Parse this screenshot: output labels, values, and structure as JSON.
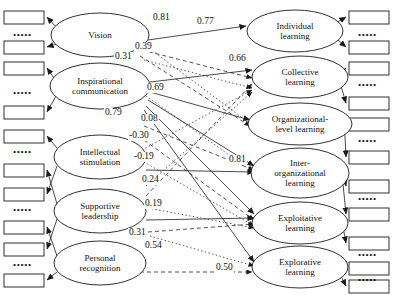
{
  "diagram": {
    "indicator_ellipsis": "•••••",
    "exogenous_constructs": [
      {
        "id": "vision",
        "label_lines": [
          "Vision"
        ],
        "cx": 100,
        "cy": 35,
        "rx": 49,
        "ry": 22
      },
      {
        "id": "inspirational",
        "label_lines": [
          "Inspirational",
          "communication"
        ],
        "cx": 100,
        "cy": 86,
        "rx": 50,
        "ry": 23
      },
      {
        "id": "intellectual",
        "label_lines": [
          "Intellectual",
          "stimulation"
        ],
        "cx": 100,
        "cy": 157,
        "rx": 46,
        "ry": 22
      },
      {
        "id": "supportive",
        "label_lines": [
          "Supportive",
          "leadership"
        ],
        "cx": 100,
        "cy": 211,
        "rx": 46,
        "ry": 22
      },
      {
        "id": "personal",
        "label_lines": [
          "Personal",
          "recognition"
        ],
        "cx": 100,
        "cy": 263,
        "rx": 46,
        "ry": 22
      }
    ],
    "endogenous_constructs": [
      {
        "id": "individual",
        "label_lines": [
          "Individual",
          "learning"
        ],
        "cx": 295,
        "cy": 31,
        "rx": 48,
        "ry": 21
      },
      {
        "id": "collective",
        "label_lines": [
          "Collective",
          "learning"
        ],
        "cx": 300,
        "cy": 77,
        "rx": 48,
        "ry": 21
      },
      {
        "id": "organizational",
        "label_lines": [
          "Organizational-",
          "level learning"
        ],
        "cx": 300,
        "cy": 124,
        "rx": 52,
        "ry": 21
      },
      {
        "id": "interorg",
        "label_lines": [
          "Inter-",
          "organizational",
          "learning"
        ],
        "cx": 300,
        "cy": 173,
        "rx": 49,
        "ry": 25
      },
      {
        "id": "exploitative",
        "label_lines": [
          "Exploitative",
          "learning"
        ],
        "cx": 300,
        "cy": 223,
        "rx": 48,
        "ry": 21
      },
      {
        "id": "explorative",
        "label_lines": [
          "Explorative",
          "learning"
        ],
        "cx": 300,
        "cy": 267,
        "rx": 48,
        "ry": 21
      }
    ],
    "left_indicator_boxes": [
      {
        "x": 4,
        "y": 11,
        "w": 40,
        "h": 13
      },
      {
        "x": 4,
        "y": 41,
        "w": 40,
        "h": 13
      },
      {
        "x": 4,
        "y": 62,
        "w": 40,
        "h": 13
      },
      {
        "x": 4,
        "y": 106,
        "w": 40,
        "h": 13
      },
      {
        "x": 4,
        "y": 130,
        "w": 40,
        "h": 13
      },
      {
        "x": 4,
        "y": 164,
        "w": 40,
        "h": 13
      },
      {
        "x": 4,
        "y": 188,
        "w": 40,
        "h": 13
      },
      {
        "x": 4,
        "y": 221,
        "w": 40,
        "h": 13
      },
      {
        "x": 4,
        "y": 243,
        "w": 40,
        "h": 13
      },
      {
        "x": 4,
        "y": 274,
        "w": 40,
        "h": 13
      }
    ],
    "left_dot_rows": [
      {
        "x": 13,
        "y": 31
      },
      {
        "x": 13,
        "y": 89
      },
      {
        "x": 13,
        "y": 148
      },
      {
        "x": 13,
        "y": 206
      },
      {
        "x": 13,
        "y": 261
      }
    ],
    "right_indicator_boxes": [
      {
        "x": 349,
        "y": 11,
        "w": 40,
        "h": 13
      },
      {
        "x": 349,
        "y": 41,
        "w": 40,
        "h": 13
      },
      {
        "x": 349,
        "y": 62,
        "w": 40,
        "h": 13
      },
      {
        "x": 349,
        "y": 97,
        "w": 40,
        "h": 13
      },
      {
        "x": 349,
        "y": 118,
        "w": 40,
        "h": 13
      },
      {
        "x": 349,
        "y": 151,
        "w": 40,
        "h": 13
      },
      {
        "x": 349,
        "y": 180,
        "w": 40,
        "h": 13
      },
      {
        "x": 349,
        "y": 208,
        "w": 40,
        "h": 13
      },
      {
        "x": 349,
        "y": 237,
        "w": 40,
        "h": 13
      },
      {
        "x": 349,
        "y": 262,
        "w": 40,
        "h": 13
      },
      {
        "x": 349,
        "y": 280,
        "w": 40,
        "h": 13
      }
    ],
    "right_dot_rows": [
      {
        "x": 358,
        "y": 31
      },
      {
        "x": 358,
        "y": 81
      },
      {
        "x": 358,
        "y": 137
      },
      {
        "x": 358,
        "y": 195
      },
      {
        "x": 358,
        "y": 251
      },
      {
        "x": 358,
        "y": 276
      }
    ],
    "path_coefficients": [
      {
        "value": "0.81",
        "x": 152,
        "y": 13
      },
      {
        "value": "0.39",
        "x": 134,
        "y": 42
      },
      {
        "value": "0.31",
        "x": 114,
        "y": 52
      },
      {
        "value": "0.69",
        "x": 146,
        "y": 83
      },
      {
        "value": "0.77",
        "x": 196,
        "y": 17
      },
      {
        "value": "0.66",
        "x": 228,
        "y": 54
      },
      {
        "value": "0.79",
        "x": 104,
        "y": 108
      },
      {
        "value": "0.08",
        "x": 140,
        "y": 114
      },
      {
        "value": "-0.30",
        "x": 128,
        "y": 131
      },
      {
        "value": "-0.19",
        "x": 133,
        "y": 152
      },
      {
        "value": "0.24",
        "x": 141,
        "y": 175
      },
      {
        "value": "0.19",
        "x": 144,
        "y": 199
      },
      {
        "value": "0.81",
        "x": 228,
        "y": 155
      },
      {
        "value": "0.31",
        "x": 128,
        "y": 228
      },
      {
        "value": "0.54",
        "x": 144,
        "y": 241
      },
      {
        "value": "0.50",
        "x": 215,
        "y": 263
      }
    ]
  }
}
